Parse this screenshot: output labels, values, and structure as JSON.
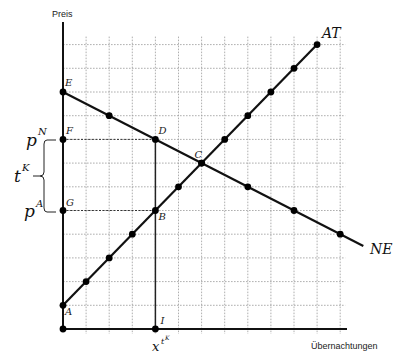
{
  "diagram": {
    "axes": {
      "y_label": "Preis",
      "x_label": "Übernachtungen",
      "x_max": 12,
      "y_max": 12
    },
    "curves": [
      {
        "id": "AT",
        "label": "AT",
        "from": [
          0,
          1
        ],
        "to": [
          11,
          12
        ],
        "dots": [
          [
            0,
            1
          ],
          [
            1,
            2
          ],
          [
            2,
            3
          ],
          [
            3,
            4
          ],
          [
            4,
            5
          ],
          [
            5,
            6
          ],
          [
            6,
            7
          ],
          [
            7,
            8
          ],
          [
            8,
            9
          ],
          [
            9,
            10
          ],
          [
            10,
            11
          ],
          [
            11,
            12
          ]
        ]
      },
      {
        "id": "NE",
        "label": "NE",
        "from": [
          0,
          10
        ],
        "to": [
          13,
          3.5
        ],
        "dots": [
          [
            0,
            10
          ],
          [
            2,
            9
          ],
          [
            4,
            8
          ],
          [
            6,
            7
          ],
          [
            8,
            6
          ],
          [
            10,
            5
          ],
          [
            12,
            4
          ]
        ]
      }
    ],
    "points": [
      {
        "name": "A",
        "x": 0,
        "y": 1
      },
      {
        "name": "B",
        "x": 4,
        "y": 5
      },
      {
        "name": "C",
        "x": 6,
        "y": 7
      },
      {
        "name": "D",
        "x": 4,
        "y": 8
      },
      {
        "name": "E",
        "x": 0,
        "y": 10
      },
      {
        "name": "F",
        "x": 0,
        "y": 8
      },
      {
        "name": "G",
        "x": 0,
        "y": 5
      },
      {
        "name": "I",
        "x": 4,
        "y": 0
      }
    ],
    "extra_dots": [
      [
        0,
        0
      ],
      [
        0,
        8
      ],
      [
        0,
        5
      ],
      [
        4,
        0
      ]
    ],
    "guides": [
      {
        "type": "dashed",
        "from": [
          0,
          8
        ],
        "to": [
          4,
          8
        ]
      },
      {
        "type": "dashed",
        "from": [
          0,
          5
        ],
        "to": [
          4,
          5
        ]
      },
      {
        "type": "solid",
        "from": [
          4,
          8
        ],
        "to": [
          4,
          0
        ]
      }
    ],
    "annotations": {
      "pN": {
        "base": "p",
        "sup": "N"
      },
      "pA": {
        "base": "p",
        "sup": "A"
      },
      "tK": {
        "base": "t",
        "sup": "K"
      },
      "xtK": {
        "base": "x",
        "sup": "t",
        "supsup": "K"
      }
    }
  }
}
